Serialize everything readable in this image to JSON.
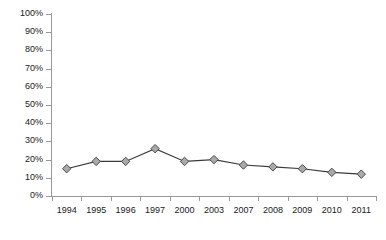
{
  "chart_data": {
    "type": "line",
    "title": "",
    "subtitle": "",
    "xlabel": "",
    "ylabel": "",
    "categories": [
      "1994",
      "1995",
      "1996",
      "1997",
      "2000",
      "2003",
      "2007",
      "2008",
      "2009",
      "2010",
      "2011"
    ],
    "values": [
      15,
      19,
      19,
      26,
      19,
      20,
      17,
      16,
      15,
      13,
      12
    ],
    "series": [
      {
        "name": "",
        "values": [
          15,
          19,
          19,
          26,
          19,
          20,
          17,
          16,
          15,
          13,
          12
        ]
      }
    ],
    "ylim": [
      0,
      100
    ],
    "ytick_values": [
      0,
      10,
      20,
      30,
      40,
      50,
      60,
      70,
      80,
      90,
      100
    ],
    "ytick_labels": [
      "0%",
      "10%",
      "20%",
      "30%",
      "40%",
      "50%",
      "60%",
      "70%",
      "80%",
      "90%",
      "100%"
    ],
    "value_suffix": "%",
    "grid": false,
    "legend": false,
    "legend_position": "none",
    "marker": "diamond",
    "colors": {
      "line": "#3b3b3b",
      "marker_fill": "#a9a9a9",
      "marker_edge": "#4a4a4a",
      "axis": "#9a9a9a",
      "text": "#1a1a1a",
      "background": "#ffffff"
    }
  }
}
